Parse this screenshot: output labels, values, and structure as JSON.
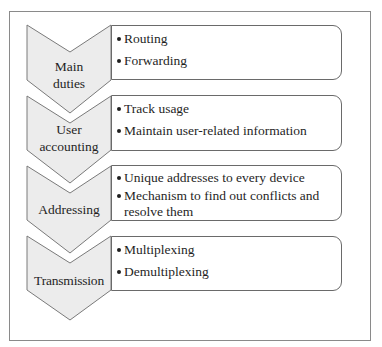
{
  "diagram": {
    "stages": [
      {
        "label_lines": [
          "Main",
          "duties"
        ],
        "items": [
          "Routing",
          "Forwarding"
        ]
      },
      {
        "label_lines": [
          "User",
          "accounting"
        ],
        "items": [
          "Track usage",
          "Maintain user-related information"
        ]
      },
      {
        "label_lines": [
          "Addressing"
        ],
        "items": [
          "Unique addresses to every device",
          "Mechanism to find out conflicts and resolve them"
        ]
      },
      {
        "label_lines": [
          "Transmission"
        ],
        "items": [
          "Multiplexing",
          "Demultiplexing"
        ]
      }
    ],
    "colors": {
      "chevron_fill": "#ececec",
      "chevron_stroke": "#7a7a7a",
      "box_stroke": "#6a6a6a",
      "frame_stroke": "#8a8a8a"
    }
  }
}
